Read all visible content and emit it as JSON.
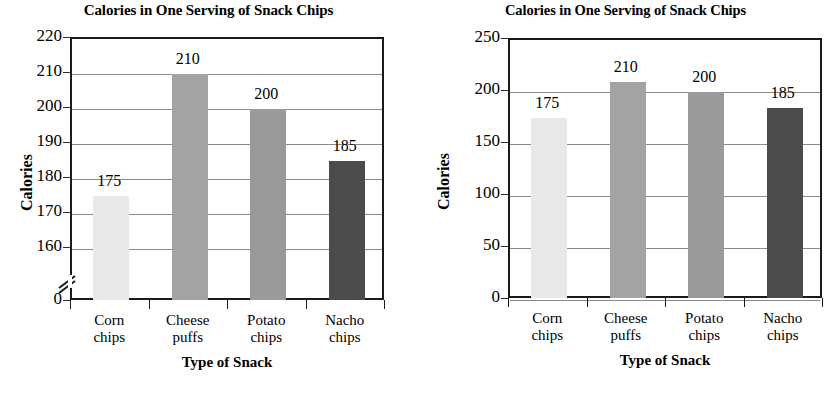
{
  "chart_data": [
    {
      "id": "left",
      "type": "bar",
      "title": "Calories in One Serving of Snack Chips",
      "xlabel": "Type of Snack",
      "ylabel": "Calories",
      "categories": [
        "Corn chips",
        "Cheese puffs",
        "Potato chips",
        "Nacho chips"
      ],
      "category_lines": [
        [
          "Corn",
          "chips"
        ],
        [
          "Cheese",
          "puffs"
        ],
        [
          "Potato",
          "chips"
        ],
        [
          "Nacho",
          "chips"
        ]
      ],
      "values": [
        175,
        210,
        200,
        185
      ],
      "value_labels": [
        "175",
        "210",
        "200",
        "185"
      ],
      "ytick_labels": [
        "220",
        "210",
        "200",
        "190",
        "180",
        "170",
        "160",
        "0"
      ],
      "ytick_values": [
        220,
        210,
        200,
        190,
        180,
        170,
        160,
        0
      ],
      "ylim": [
        155,
        220
      ],
      "axis_break": true,
      "axis_break_between": [
        0,
        160
      ],
      "grid": true,
      "legend": "none",
      "bar_colors": [
        "#e9e9e9",
        "#a3a3a3",
        "#9a9a9a",
        "#4b4b4b"
      ]
    },
    {
      "id": "right",
      "type": "bar",
      "title": "Calories in One Serving of Snack Chips",
      "xlabel": "Type of Snack",
      "ylabel": "Calories",
      "categories": [
        "Corn chips",
        "Cheese puffs",
        "Potato chips",
        "Nacho chips"
      ],
      "category_lines": [
        [
          "Corn",
          "chips"
        ],
        [
          "Cheese",
          "puffs"
        ],
        [
          "Potato",
          "chips"
        ],
        [
          "Nacho",
          "chips"
        ]
      ],
      "values": [
        175,
        210,
        200,
        185
      ],
      "value_labels": [
        "175",
        "210",
        "200",
        "185"
      ],
      "ytick_labels": [
        "250",
        "200",
        "150",
        "100",
        "50",
        "0"
      ],
      "ytick_values": [
        250,
        200,
        150,
        100,
        50,
        0
      ],
      "ylim": [
        0,
        250
      ],
      "axis_break": false,
      "grid": true,
      "legend": "none",
      "bar_colors": [
        "#e9e9e9",
        "#a3a3a3",
        "#9a9a9a",
        "#4b4b4b"
      ]
    }
  ]
}
